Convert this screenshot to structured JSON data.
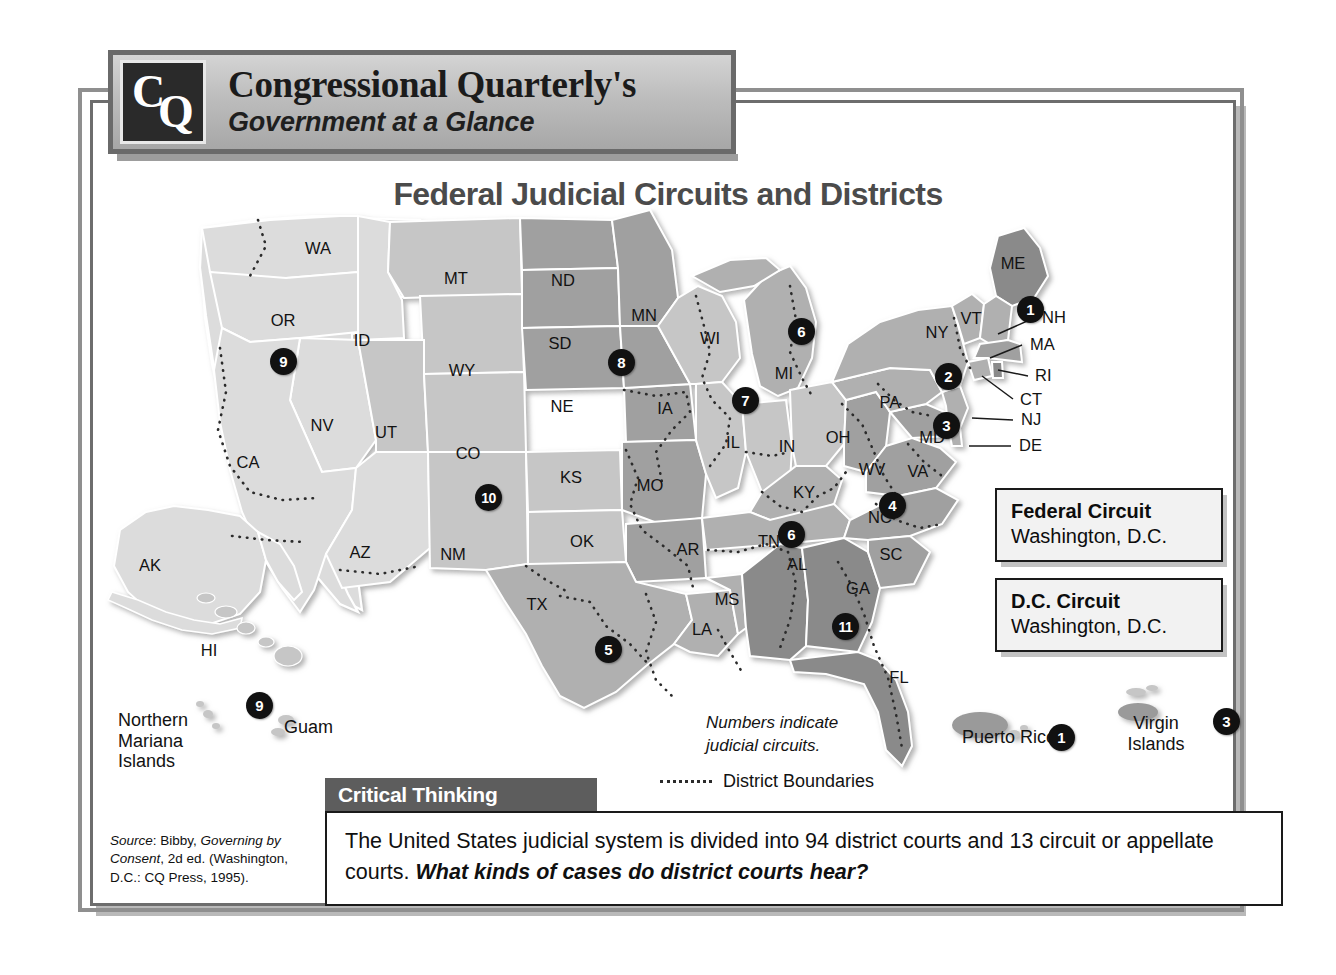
{
  "header": {
    "logo_c": "C",
    "logo_q": "Q",
    "title": "Congressional Quarterly's",
    "subtitle": "Government at a Glance"
  },
  "map": {
    "title": "Federal Judicial Circuits and Districts",
    "state_labels": [
      {
        "abbr": "WA",
        "x": 228,
        "y": 154
      },
      {
        "abbr": "OR",
        "x": 193,
        "y": 226
      },
      {
        "abbr": "ID",
        "x": 272,
        "y": 246
      },
      {
        "abbr": "MT",
        "x": 366,
        "y": 184
      },
      {
        "abbr": "WY",
        "x": 372,
        "y": 276
      },
      {
        "abbr": "NV",
        "x": 232,
        "y": 331
      },
      {
        "abbr": "CA",
        "x": 158,
        "y": 368
      },
      {
        "abbr": "UT",
        "x": 296,
        "y": 338
      },
      {
        "abbr": "CO",
        "x": 378,
        "y": 359
      },
      {
        "abbr": "AZ",
        "x": 270,
        "y": 458
      },
      {
        "abbr": "NM",
        "x": 363,
        "y": 460
      },
      {
        "abbr": "ND",
        "x": 473,
        "y": 186
      },
      {
        "abbr": "SD",
        "x": 470,
        "y": 249
      },
      {
        "abbr": "MN",
        "x": 554,
        "y": 221
      },
      {
        "abbr": "NE",
        "x": 472,
        "y": 312
      },
      {
        "abbr": "KS",
        "x": 481,
        "y": 383
      },
      {
        "abbr": "OK",
        "x": 492,
        "y": 447
      },
      {
        "abbr": "TX",
        "x": 447,
        "y": 510
      },
      {
        "abbr": "WI",
        "x": 620,
        "y": 244
      },
      {
        "abbr": "IA",
        "x": 575,
        "y": 314
      },
      {
        "abbr": "MO",
        "x": 560,
        "y": 391
      },
      {
        "abbr": "AR",
        "x": 598,
        "y": 455
      },
      {
        "abbr": "LA",
        "x": 612,
        "y": 535
      },
      {
        "abbr": "MS",
        "x": 637,
        "y": 505
      },
      {
        "abbr": "IL",
        "x": 643,
        "y": 348
      },
      {
        "abbr": "MI",
        "x": 694,
        "y": 279
      },
      {
        "abbr": "IN",
        "x": 697,
        "y": 352
      },
      {
        "abbr": "OH",
        "x": 748,
        "y": 343
      },
      {
        "abbr": "KY",
        "x": 714,
        "y": 398
      },
      {
        "abbr": "TN",
        "x": 679,
        "y": 447
      },
      {
        "abbr": "AL",
        "x": 707,
        "y": 470
      },
      {
        "abbr": "GA",
        "x": 768,
        "y": 494
      },
      {
        "abbr": "FL",
        "x": 809,
        "y": 583
      },
      {
        "abbr": "SC",
        "x": 801,
        "y": 460
      },
      {
        "abbr": "NC",
        "x": 790,
        "y": 423
      },
      {
        "abbr": "WV",
        "x": 782,
        "y": 375
      },
      {
        "abbr": "VA",
        "x": 828,
        "y": 377
      },
      {
        "abbr": "PA",
        "x": 800,
        "y": 308
      },
      {
        "abbr": "NY",
        "x": 847,
        "y": 238
      },
      {
        "abbr": "VT",
        "x": 881,
        "y": 224
      },
      {
        "abbr": "ME",
        "x": 923,
        "y": 169
      },
      {
        "abbr": "MD",
        "x": 842,
        "y": 343
      },
      {
        "abbr": "AK",
        "x": 60,
        "y": 471
      },
      {
        "abbr": "HI",
        "x": 119,
        "y": 556
      }
    ],
    "leader_labels": [
      {
        "abbr": "NH",
        "x": 952,
        "y": 223,
        "lx1": 908,
        "ly1": 234,
        "lx2": 944,
        "ly2": 218
      },
      {
        "abbr": "MA",
        "x": 940,
        "y": 250,
        "lx1": 900,
        "ly1": 258,
        "lx2": 932,
        "ly2": 245
      },
      {
        "abbr": "RI",
        "x": 945,
        "y": 281,
        "lx1": 906,
        "ly1": 268,
        "lx2": 938,
        "ly2": 276
      },
      {
        "abbr": "CT",
        "x": 930,
        "y": 305,
        "lx1": 892,
        "ly1": 276,
        "lx2": 923,
        "ly2": 299
      },
      {
        "abbr": "NJ",
        "x": 931,
        "y": 325,
        "lx1": 882,
        "ly1": 318,
        "lx2": 923,
        "ly2": 320
      },
      {
        "abbr": "DE",
        "x": 929,
        "y": 351,
        "lx1": 879,
        "ly1": 346,
        "lx2": 921,
        "ly2": 346
      }
    ],
    "badges": [
      {
        "n": "9",
        "x": 180,
        "y": 248
      },
      {
        "n": "10",
        "x": 385,
        "y": 384
      },
      {
        "n": "5",
        "x": 505,
        "y": 536
      },
      {
        "n": "8",
        "x": 518,
        "y": 249
      },
      {
        "n": "7",
        "x": 642,
        "y": 287
      },
      {
        "n": "6",
        "x": 698,
        "y": 218
      },
      {
        "n": "6",
        "x": 688,
        "y": 421
      },
      {
        "n": "11",
        "x": 742,
        "y": 513
      },
      {
        "n": "4",
        "x": 789,
        "y": 392
      },
      {
        "n": "3",
        "x": 843,
        "y": 312
      },
      {
        "n": "2",
        "x": 845,
        "y": 263
      },
      {
        "n": "1",
        "x": 927,
        "y": 196
      },
      {
        "n": "9",
        "x": 156,
        "y": 592
      },
      {
        "n": "1",
        "x": 958,
        "y": 624
      },
      {
        "n": "3",
        "x": 1123,
        "y": 608
      }
    ],
    "circuit_boxes": [
      {
        "title": "Federal Circuit",
        "sub": "Washington, D.C.",
        "x": 995,
        "y": 488,
        "w": 228
      },
      {
        "title": "D.C.  Circuit",
        "sub": "Washington, D.C.",
        "x": 995,
        "y": 578,
        "w": 228
      }
    ],
    "legend": {
      "numbers_note": "Numbers indicate\njudicial circuits.",
      "district_boundaries": "District Boundaries"
    },
    "territories": [
      {
        "name": "Northern\nMariana\nIslands",
        "x": 118,
        "y": 710,
        "align": "left"
      },
      {
        "name": "Guam",
        "x": 284,
        "y": 717,
        "align": "left"
      },
      {
        "name": "Puerto Rico",
        "x": 1009,
        "y": 727,
        "align": "center"
      },
      {
        "name": "Virgin\nIslands",
        "x": 1156,
        "y": 713,
        "align": "center"
      }
    ]
  },
  "critical_thinking": {
    "tab_label": "Critical Thinking",
    "body_plain_1": "The United States judicial system is divided into 94 district courts and 13 circuit or appellate courts. ",
    "body_bold": "What kinds of cases do district courts hear?"
  },
  "source": {
    "prefix": "Source",
    "text_1": ": Bibby, ",
    "italic_1": "Governing by Consent",
    "text_2": ", 2d ed. (Washington, D.C.: CQ Press, 1995)."
  },
  "colors": {
    "circuit_light": "#dcdcdc",
    "circuit_mid_light": "#c6c6c6",
    "circuit_mid": "#b0b0b0",
    "circuit_gray": "#a0a0a0",
    "circuit_dark": "#8a8a8a",
    "badge_bg": "#111111",
    "frame": "#8f8f8f",
    "tab_bg": "#5d5d5d"
  }
}
